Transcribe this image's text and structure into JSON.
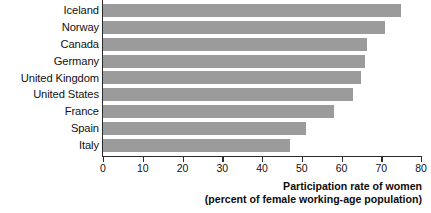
{
  "chart_data": {
    "type": "bar",
    "orientation": "horizontal",
    "title": "",
    "subtitle": "",
    "xlabel": "Participation rate of women (percent of female working-age population)",
    "ylabel": "",
    "categories": [
      "Iceland",
      "Norway",
      "Canada",
      "Germany",
      "United Kingdom",
      "United States",
      "France",
      "Spain",
      "Italy"
    ],
    "values": [
      75,
      71,
      66.5,
      66,
      65,
      62.8,
      58,
      51,
      47
    ],
    "xlim": [
      0,
      80
    ],
    "xticks": [
      0,
      10,
      20,
      30,
      40,
      50,
      60,
      70,
      80
    ],
    "xtick_labels": [
      "0",
      "10",
      "20",
      "30",
      "40",
      "50",
      "60",
      "70",
      "80"
    ],
    "grid": false,
    "legend": false,
    "bar_color": "#9b9b9b",
    "axis_color": "#2b2b2b"
  },
  "axis_caption": {
    "line1": "Participation rate of women",
    "line2": "(percent of female working-age population)"
  }
}
